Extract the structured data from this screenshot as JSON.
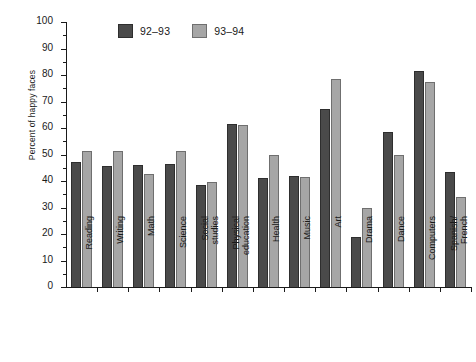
{
  "chart_data": {
    "type": "bar",
    "title": "",
    "xlabel": "",
    "ylabel": "Percent of happy faces",
    "ylim": [
      0,
      100
    ],
    "ytick_step": 10,
    "grid": false,
    "legend_position": "top-left",
    "categories": [
      "Reading",
      "Writing",
      "Math",
      "Science",
      "Social studies",
      "Physical education",
      "Health",
      "Music",
      "Art",
      "Drama",
      "Dance",
      "Computers",
      "Spanish/French"
    ],
    "category_lines": [
      [
        "Reading"
      ],
      [
        "Writing"
      ],
      [
        "Math"
      ],
      [
        "Science"
      ],
      [
        "Social",
        "studies"
      ],
      [
        "Physical",
        "education"
      ],
      [
        "Health"
      ],
      [
        "Music"
      ],
      [
        "Art"
      ],
      [
        "Drama"
      ],
      [
        "Dance"
      ],
      [
        "Computers"
      ],
      [
        "Spanish/",
        "French"
      ]
    ],
    "ytick_labels": [
      "0",
      "10",
      "20",
      "30",
      "40",
      "50",
      "60",
      "70",
      "80",
      "90",
      "100"
    ],
    "series": [
      {
        "name": "92-93",
        "color": "#4a4a4a",
        "values": [
          47,
          45.5,
          46,
          46.5,
          38.5,
          61.5,
          41,
          42,
          67,
          19,
          58.5,
          81.5,
          43.5
        ]
      },
      {
        "name": "93-94",
        "color": "#a6a6a6",
        "values": [
          51.5,
          51.5,
          42.5,
          51.5,
          39.5,
          61,
          50,
          41.5,
          78.5,
          30,
          50,
          77.5,
          34
        ]
      }
    ]
  },
  "legend": {
    "entries": [
      {
        "label": "92–93",
        "swatch": "dark-gray-swatch"
      },
      {
        "label": "93–94",
        "swatch": "light-gray-swatch"
      }
    ]
  }
}
